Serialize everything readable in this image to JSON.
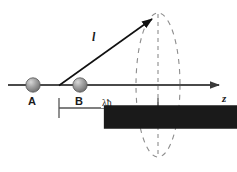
{
  "figure": {
    "background_color": "#ffffff",
    "line_color": "#4d4d4d",
    "dash_color": "#808080",
    "text_color": "#1a1a1a",
    "sphere_color": "#8c8c8c",
    "width": 237,
    "height": 172
  },
  "labels": {
    "atom_a": "A",
    "atom_b": "B",
    "axis_z": "z",
    "vector_l": "l",
    "dimension": "λħ"
  },
  "geometry": {
    "axis": {
      "x1": 8,
      "y1": 85,
      "x2": 228,
      "y2": 85
    },
    "sphere_a": {
      "cx": 33,
      "cy": 85,
      "r": 7
    },
    "sphere_b": {
      "cx": 80,
      "cy": 85,
      "r": 7
    },
    "vector": {
      "x1": 59,
      "y1": 85,
      "x2": 158,
      "y2": 15
    },
    "ellipse": {
      "cx": 158,
      "cy": 85,
      "rx": 22,
      "ry": 72
    },
    "center_dash": {
      "x": 158,
      "y1": 13,
      "y2": 157
    },
    "dimension_bracket": {
      "x1": 59,
      "x2": 158,
      "y": 108,
      "tick_half": 10
    }
  }
}
